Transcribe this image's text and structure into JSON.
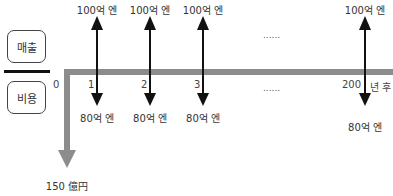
{
  "legend": {
    "revenue_label": "매출",
    "cost_label": "비용"
  },
  "timeline": {
    "origin_label": "0",
    "unit_label": "년 후",
    "ellipsis": "......",
    "periods": [
      {
        "label": "1",
        "revenue": "100억 엔",
        "cost": "80억 엔"
      },
      {
        "label": "2",
        "revenue": "100억 엔",
        "cost": "80억 엔"
      },
      {
        "label": "3",
        "revenue": "100억 엔",
        "cost": "80억 엔"
      },
      {
        "label": "200",
        "revenue": "100억 엔",
        "cost": "80억 엔"
      }
    ]
  },
  "initial_investment": {
    "label": "150 億円"
  },
  "colors": {
    "timeline_gray": "#8c8c8c",
    "arrow_black": "#111111"
  }
}
